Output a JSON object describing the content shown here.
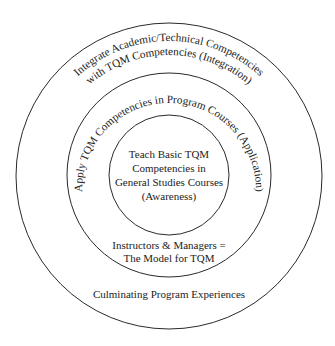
{
  "diagram": {
    "type": "concentric-circles",
    "stroke_color": "#2a2a2a",
    "text_color": "#222222",
    "rings": {
      "outer": {
        "arc_text_line1": "Integrate Academic/Technical Competencies",
        "arc_text_line2": "with TQM Competencies (Integration)",
        "bottom_text": "Culminating Program Experiences"
      },
      "middle": {
        "arc_text": "Apply TQM Competencies in Program Courses (Application)",
        "bottom_text_line1": "Instructors & Managers =",
        "bottom_text_line2": "The Model for TQM"
      },
      "inner": {
        "text_lines": [
          "Teach Basic TQM",
          "Competencies in",
          "General Studies Courses",
          "(Awareness)"
        ]
      }
    }
  }
}
